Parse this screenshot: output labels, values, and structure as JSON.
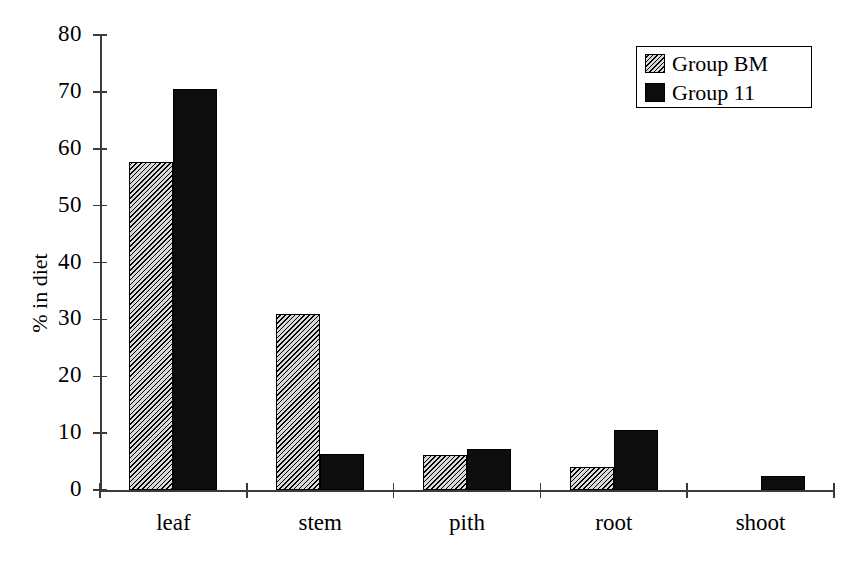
{
  "chart_data": {
    "type": "bar",
    "title": "",
    "subtitle": "",
    "xlabel": "",
    "ylabel": "% in diet",
    "categories": [
      "leaf",
      "stem",
      "pith",
      "root",
      "shoot"
    ],
    "series": [
      {
        "name": "Group BM",
        "style": "hatched",
        "color": "#d9d9d9",
        "values": [
          57.7,
          31.0,
          6.2,
          4.1,
          0.0
        ]
      },
      {
        "name": "Group 11",
        "style": "solid",
        "color": "#0d0d0d",
        "values": [
          70.5,
          6.3,
          7.2,
          10.5,
          2.5
        ]
      }
    ],
    "ylim": [
      0,
      80
    ],
    "ytick_labels": [
      "0",
      "10",
      "20",
      "30",
      "40",
      "50",
      "60",
      "70",
      "80"
    ],
    "ytick_values": [
      0,
      10,
      20,
      30,
      40,
      50,
      60,
      70,
      80
    ],
    "grid": false,
    "legend_position": "top-right",
    "legend_entries": [
      "Group BM",
      "Group 11"
    ]
  }
}
